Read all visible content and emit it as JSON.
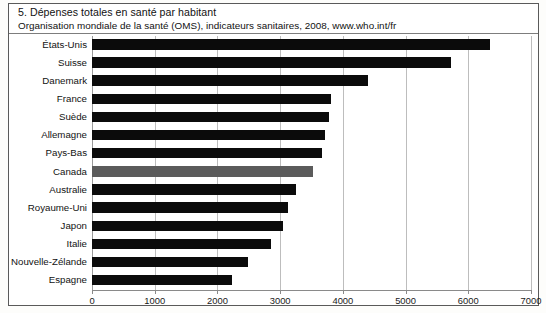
{
  "figure": {
    "number": "5.",
    "title": "5. Dépenses totales en santé par habitant",
    "source": "Organisation mondiale de la santé (OMS), indicateurs sanitaires, 2008, www.who.int/fr"
  },
  "colors": {
    "bar": "#0b0b0b",
    "bar_highlight": "#5b5b5b",
    "grid": "#bdbdbd",
    "axis": "#8a8a8a",
    "frame": "#5a5a5a",
    "background": "#ffffff",
    "text": "#111111"
  },
  "chart_data": {
    "type": "bar",
    "orientation": "horizontal",
    "title": "Dépenses totales en santé par habitant",
    "subtitle": "Organisation mondiale de la santé (OMS), indicateurs sanitaires, 2008, www.who.int/fr",
    "xlabel": "",
    "ylabel": "",
    "xlim": [
      0,
      7000
    ],
    "xticks": [
      0,
      1000,
      2000,
      3000,
      4000,
      5000,
      6000,
      7000
    ],
    "xtick_labels": [
      "0",
      "1000",
      "2000",
      "3000",
      "4000",
      "5000",
      "6000",
      "7000"
    ],
    "grid": true,
    "legend": false,
    "highlight_category": "Canada",
    "categories": [
      "États-Unis",
      "Suisse",
      "Danemark",
      "France",
      "Suède",
      "Allemagne",
      "Pays-Bas",
      "Canada",
      "Australie",
      "Royaume-Uni",
      "Japon",
      "Italie",
      "Nouvelle-Zélande",
      "Espagne"
    ],
    "values": [
      6350,
      5720,
      4400,
      3810,
      3780,
      3720,
      3670,
      3520,
      3250,
      3130,
      3050,
      2860,
      2490,
      2230
    ],
    "bars": [
      {
        "label": "États-Unis",
        "value": 6350,
        "highlight": false
      },
      {
        "label": "Suisse",
        "value": 5720,
        "highlight": false
      },
      {
        "label": "Danemark",
        "value": 4400,
        "highlight": false
      },
      {
        "label": "France",
        "value": 3810,
        "highlight": false
      },
      {
        "label": "Suède",
        "value": 3780,
        "highlight": false
      },
      {
        "label": "Allemagne",
        "value": 3720,
        "highlight": false
      },
      {
        "label": "Pays-Bas",
        "value": 3670,
        "highlight": false
      },
      {
        "label": "Canada",
        "value": 3520,
        "highlight": true
      },
      {
        "label": "Australie",
        "value": 3250,
        "highlight": false
      },
      {
        "label": "Royaume-Uni",
        "value": 3130,
        "highlight": false
      },
      {
        "label": "Japon",
        "value": 3050,
        "highlight": false
      },
      {
        "label": "Italie",
        "value": 2860,
        "highlight": false
      },
      {
        "label": "Nouvelle-Zélande",
        "value": 2490,
        "highlight": false
      },
      {
        "label": "Espagne",
        "value": 2230,
        "highlight": false
      }
    ]
  }
}
